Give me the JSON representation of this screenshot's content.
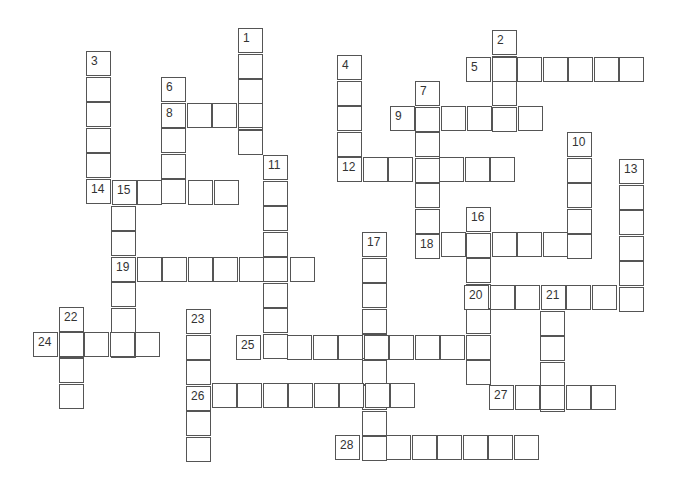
{
  "puzzle": {
    "type": "crossword",
    "cell_size": 25.5,
    "border_color": "#555555",
    "words": [
      {
        "number": "1",
        "dir": "down",
        "x": 238,
        "y": 28,
        "len": 5
      },
      {
        "number": "2",
        "dir": "down",
        "x": 492,
        "y": 30,
        "len": 4
      },
      {
        "number": "3",
        "dir": "down",
        "x": 86,
        "y": 51,
        "len": 6
      },
      {
        "number": "4",
        "dir": "down",
        "x": 337,
        "y": 55,
        "len": 5
      },
      {
        "number": "5",
        "dir": "across",
        "x": 466,
        "y": 57,
        "len": 7
      },
      {
        "number": "6",
        "dir": "down",
        "x": 161,
        "y": 77,
        "len": 5
      },
      {
        "number": "7",
        "dir": "down",
        "x": 415,
        "y": 81,
        "len": 7
      },
      {
        "number": "8",
        "dir": "across",
        "x": 161,
        "y": 103,
        "len": 4
      },
      {
        "number": "9",
        "dir": "across",
        "x": 390,
        "y": 106,
        "len": 6
      },
      {
        "number": "10",
        "dir": "down",
        "x": 567,
        "y": 132,
        "len": 5
      },
      {
        "number": "11",
        "dir": "down",
        "x": 263,
        "y": 155,
        "len": 8
      },
      {
        "number": "12",
        "dir": "across",
        "x": 337,
        "y": 157,
        "len": 7
      },
      {
        "number": "13",
        "dir": "down",
        "x": 619,
        "y": 159,
        "len": 6
      },
      {
        "number": "14",
        "dir": "across",
        "x": 86,
        "y": 180,
        "len": 6
      },
      {
        "number": "15",
        "dir": "down",
        "x": 111,
        "y": 180,
        "len": 7
      },
      {
        "number": "16",
        "dir": "down",
        "x": 466,
        "y": 207,
        "len": 7
      },
      {
        "number": "17",
        "dir": "down",
        "x": 362,
        "y": 232,
        "len": 9
      },
      {
        "number": "18",
        "dir": "across",
        "x": 415,
        "y": 232,
        "len": 7
      },
      {
        "number": "19",
        "dir": "across",
        "x": 111,
        "y": 257,
        "len": 8
      },
      {
        "number": "20",
        "dir": "across",
        "x": 464,
        "y": 285,
        "len": 7
      },
      {
        "number": "21",
        "dir": "down",
        "x": 540,
        "y": 285,
        "len": 5
      },
      {
        "number": "22",
        "dir": "down",
        "x": 59,
        "y": 307,
        "len": 4
      },
      {
        "number": "23",
        "dir": "down",
        "x": 186,
        "y": 309,
        "len": 6
      },
      {
        "number": "24",
        "dir": "across",
        "x": 33,
        "y": 332,
        "len": 5
      },
      {
        "number": "25",
        "dir": "across",
        "x": 236,
        "y": 335,
        "len": 10
      },
      {
        "number": "26",
        "dir": "across",
        "x": 186,
        "y": 383,
        "len": 9
      },
      {
        "number": "27",
        "dir": "across",
        "x": 489,
        "y": 385,
        "len": 5
      },
      {
        "number": "28",
        "dir": "across",
        "x": 335,
        "y": 435,
        "len": 8
      }
    ]
  }
}
